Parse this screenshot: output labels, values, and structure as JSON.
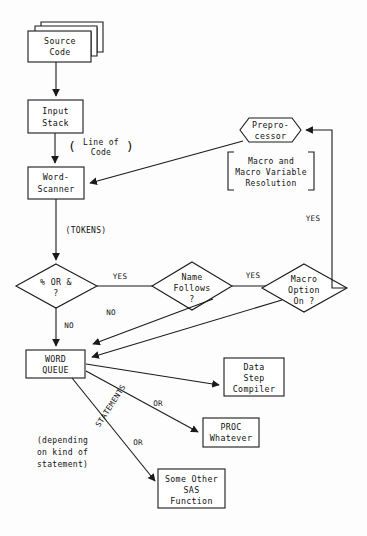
{
  "diagram": {
    "ink_color": "#1a1a1a",
    "background_color": "#fdfdfd",
    "nodes": {
      "source_code": {
        "line1": "Source",
        "line2": "Code"
      },
      "input_stack": {
        "line1": "Input",
        "line2": "Stack"
      },
      "word_scanner": {
        "line1": "Word-",
        "line2": "Scanner"
      },
      "preprocessor": {
        "line1": "Prepro-",
        "line2": "cessor"
      },
      "preprocessor_note": {
        "line1": "Macro and",
        "line2": "Macro Variable",
        "line3": "Resolution"
      },
      "decision_percent_or_amp": {
        "line1": "%  OR  &",
        "line2": "?"
      },
      "decision_name_follows": {
        "line1": "Name",
        "line2": "Follows",
        "line3": "?"
      },
      "decision_macro_option": {
        "line1": "Macro",
        "line2": "Option",
        "line3": "On ?"
      },
      "word_queue": {
        "line1": "WORD",
        "line2": "QUEUE"
      },
      "data_step_compiler": {
        "line1": "Data",
        "line2": "Step",
        "line3": "Compiler"
      },
      "proc_whatever": {
        "line1": "PROC",
        "line2": "Whatever"
      },
      "some_other_sas_function": {
        "line1": "Some Other",
        "line2": "SAS",
        "line3": "Function"
      }
    },
    "edge_labels": {
      "line_of_code_open": "(",
      "line_of_code_close": ")",
      "line_of_code_1": "Line of",
      "line_of_code_2": "Code",
      "tokens": "(TOKENS)",
      "yes_percent": "YES",
      "no_percent": "NO",
      "no_name_follows": "NO",
      "yes_name_follows": "YES",
      "no_macro_option": "NO",
      "yes_macro_option": "YES",
      "statements": "STATEMENTS",
      "or_1": "OR",
      "or_2": "OR"
    },
    "annotations": {
      "depending_1": "(depending",
      "depending_2": "on kind of",
      "depending_3": "statement)"
    }
  }
}
